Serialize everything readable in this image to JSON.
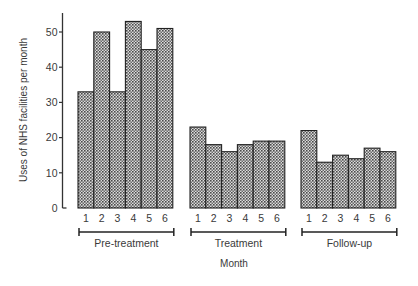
{
  "chart_data": {
    "type": "bar",
    "title": "",
    "xlabel": "Month",
    "ylabel": "Uses of NHS facilities per month",
    "ylim": [
      0,
      55
    ],
    "yticks": [
      0,
      10,
      20,
      30,
      40,
      50
    ],
    "grid": false,
    "legend": "none",
    "groups": [
      {
        "name": "Pre-treatment",
        "categories": [
          "1",
          "2",
          "3",
          "4",
          "5",
          "6"
        ],
        "values": [
          33,
          50,
          33,
          53,
          45,
          51
        ]
      },
      {
        "name": "Treatment",
        "categories": [
          "1",
          "2",
          "3",
          "4",
          "5",
          "6"
        ],
        "values": [
          23,
          18,
          16,
          18,
          19,
          19
        ]
      },
      {
        "name": "Follow-up",
        "categories": [
          "1",
          "2",
          "3",
          "4",
          "5",
          "6"
        ],
        "values": [
          22,
          13,
          15,
          14,
          17,
          16
        ]
      }
    ],
    "bar_fill": "stippled dark grey pattern",
    "colors": {
      "bar_outline": "#222222",
      "bar_dot": "#555555",
      "bar_bg": "#d8d8d8",
      "axis": "#333333",
      "text": "#3a3a3a"
    }
  }
}
